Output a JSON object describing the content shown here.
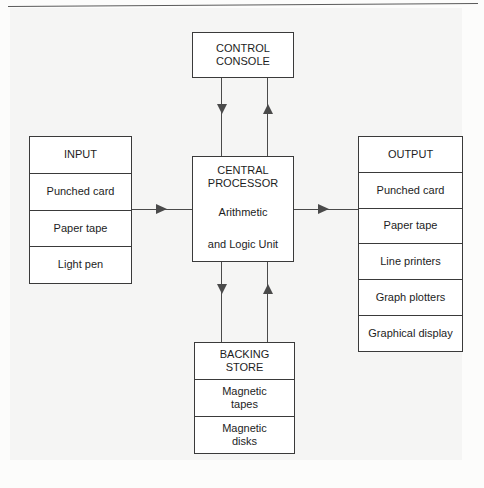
{
  "diagram": {
    "line_color": "#4a4a4a",
    "box_border_color": "#3a3a3a",
    "box_fill": "#ffffff",
    "page_background": "#f5f5f4"
  },
  "boxes": {
    "control_console": {
      "name": "CONTROL CONSOLE",
      "rows": [
        "CONTROL\nCONSOLE"
      ]
    },
    "input": {
      "name": "INPUT",
      "rows": [
        "INPUT",
        "Punched card",
        "Paper tape",
        "Light pen"
      ]
    },
    "central_processor": {
      "name": "CENTRAL PROCESSOR",
      "rows": [
        "CENTRAL\nPROCESSOR",
        "Arithmetic",
        "and Logic Unit"
      ]
    },
    "output": {
      "name": "OUTPUT",
      "rows": [
        "OUTPUT",
        "Punched card",
        "Paper tape",
        "Line printers",
        "Graph plotters",
        "Graphical display"
      ]
    },
    "backing_store": {
      "name": "BACKING STORE",
      "rows": [
        "BACKING\nSTORE",
        "Magnetic\ntapes",
        "Magnetic\ndisks"
      ]
    }
  },
  "connectors": [
    {
      "id": "console-to-cpu",
      "from": "CONTROL CONSOLE",
      "to": "CENTRAL PROCESSOR",
      "direction": "down"
    },
    {
      "id": "cpu-to-console",
      "from": "CENTRAL PROCESSOR",
      "to": "CONTROL CONSOLE",
      "direction": "up"
    },
    {
      "id": "input-to-cpu",
      "from": "INPUT",
      "to": "CENTRAL PROCESSOR",
      "direction": "right"
    },
    {
      "id": "cpu-to-output",
      "from": "CENTRAL PROCESSOR",
      "to": "OUTPUT",
      "direction": "right"
    },
    {
      "id": "cpu-to-backing-store",
      "from": "CENTRAL PROCESSOR",
      "to": "BACKING STORE",
      "direction": "down"
    },
    {
      "id": "backing-store-to-cpu",
      "from": "BACKING STORE",
      "to": "CENTRAL PROCESSOR",
      "direction": "up"
    }
  ],
  "caption": {
    "text": ""
  }
}
